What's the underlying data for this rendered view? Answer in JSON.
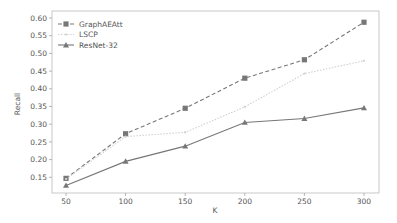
{
  "chart_data": {
    "type": "line",
    "title": "",
    "xlabel": "K",
    "ylabel": "Recall",
    "x": [
      50,
      100,
      150,
      200,
      250,
      300
    ],
    "xticks": [
      "50",
      "100",
      "150",
      "200",
      "250",
      "300"
    ],
    "yticks": [
      "0.15",
      "0.20",
      "0.25",
      "0.30",
      "0.35",
      "0.40",
      "0.45",
      "0.50",
      "0.55",
      "0.60"
    ],
    "ylim": [
      0.11,
      0.61
    ],
    "xlim": [
      37,
      313
    ],
    "grid": false,
    "legend_position": "upper left",
    "series": [
      {
        "name": "GraphAEAtt",
        "values": [
          0.147,
          0.273,
          0.345,
          0.43,
          0.482,
          0.588
        ],
        "color": "#777777",
        "linestyle": "dashed",
        "marker": "square"
      },
      {
        "name": "LSCP",
        "values": [
          0.145,
          0.265,
          0.277,
          0.349,
          0.443,
          0.479
        ],
        "color": "#d0d0d0",
        "linestyle": "dotted",
        "marker": "point"
      },
      {
        "name": "ResNet-32",
        "values": [
          0.127,
          0.195,
          0.238,
          0.305,
          0.316,
          0.346
        ],
        "color": "#777777",
        "linestyle": "solid",
        "marker": "triangle"
      }
    ]
  }
}
